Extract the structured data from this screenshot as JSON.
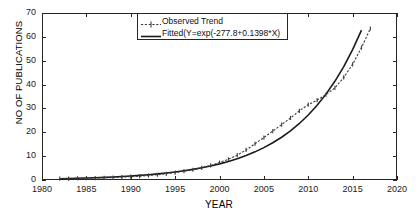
{
  "chart_data": {
    "type": "line",
    "title": "",
    "xlabel": "YEAR",
    "ylabel": "NO OF PUBLICATIONS",
    "xlim": [
      1980,
      2020
    ],
    "ylim": [
      0,
      70
    ],
    "xticks": [
      1980,
      1985,
      1990,
      1995,
      2000,
      2005,
      2010,
      2015,
      2020
    ],
    "yticks": [
      0,
      10,
      20,
      30,
      40,
      50,
      60,
      70
    ],
    "grid": false,
    "legend_position": "top-center",
    "x": [
      1982,
      1983,
      1984,
      1985,
      1986,
      1987,
      1988,
      1989,
      1990,
      1991,
      1992,
      1993,
      1994,
      1995,
      1996,
      1997,
      1998,
      1999,
      2000,
      2001,
      2002,
      2003,
      2004,
      2005,
      2006,
      2007,
      2008,
      2009,
      2010,
      2011,
      2012,
      2013,
      2014,
      2015,
      2016,
      2017
    ],
    "series": [
      {
        "name": "Observed Trend",
        "style": "dotted-with-markers",
        "color": "#3b3b3b",
        "values": [
          0.6,
          0.6,
          0.7,
          0.8,
          0.8,
          0.9,
          1.0,
          1.2,
          1.4,
          1.6,
          1.9,
          2.2,
          2.6,
          3.1,
          3.7,
          4.3,
          5.1,
          6.1,
          7.3,
          8.7,
          10.4,
          12.6,
          15.2,
          17.8,
          20.5,
          23.2,
          26.0,
          29.0,
          31.6,
          33.5,
          35.8,
          38.6,
          43.0,
          48.5,
          55.5,
          63.5
        ]
      },
      {
        "name": "Fitted(Y=exp(-277.8+0.1398*X)",
        "style": "solid",
        "color": "#1a1a1a",
        "equation": {
          "intercept": -277.8,
          "slope": 0.1398,
          "form": "Y=exp(-277.8+0.1398*X)"
        },
        "values": [
          0.55,
          0.63,
          0.73,
          0.84,
          0.96,
          1.1,
          1.27,
          1.46,
          1.68,
          1.93,
          2.22,
          2.55,
          2.93,
          3.37,
          3.87,
          4.45,
          5.12,
          5.88,
          6.76,
          7.77,
          8.93,
          10.27,
          11.8,
          13.57,
          15.6,
          17.93,
          20.61,
          23.69,
          27.24,
          31.31,
          35.99,
          41.37,
          47.56,
          54.67,
          62.84,
          72.24
        ]
      }
    ]
  },
  "axes": {
    "ylabel_text": "NO OF PUBLICATIONS",
    "xlabel_text": "YEAR",
    "xtick_labels": [
      "1980",
      "1985",
      "1990",
      "1995",
      "2000",
      "2005",
      "2010",
      "2015",
      "2020"
    ],
    "ytick_labels": [
      "0",
      "10",
      "20",
      "30",
      "40",
      "50",
      "60",
      "70"
    ]
  },
  "legend": {
    "entries": [
      {
        "label": "Observed Trend",
        "marker": "dotted-line-with-marker"
      },
      {
        "label": "Fitted(Y=exp(-277.8+0.1398*X)",
        "marker": "solid-line"
      }
    ]
  },
  "colors": {
    "axis": "#262626",
    "observed": "#3b3b3b",
    "fitted": "#1a1a1a",
    "background": "#ffffff"
  }
}
